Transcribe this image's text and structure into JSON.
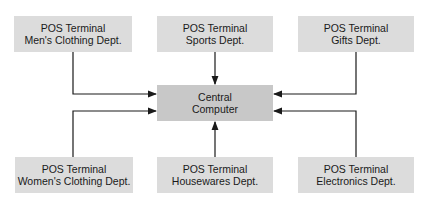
{
  "diagram": {
    "central": {
      "line1": "Central",
      "line2": "Computer"
    },
    "terminals": [
      {
        "id": "mens",
        "line1": "POS Terminal",
        "line2": "Men's Clothing Dept."
      },
      {
        "id": "sports",
        "line1": "POS Terminal",
        "line2": "Sports Dept."
      },
      {
        "id": "gifts",
        "line1": "POS Terminal",
        "line2": "Gifts Dept."
      },
      {
        "id": "womens",
        "line1": "POS Terminal",
        "line2": "Women's Clothing Dept."
      },
      {
        "id": "housewares",
        "line1": "POS Terminal",
        "line2": "Housewares Dept."
      },
      {
        "id": "electronics",
        "line1": "POS Terminal",
        "line2": "Electronics Dept."
      }
    ],
    "colors": {
      "terminal_fill": "#dcdcdc",
      "central_fill": "#c8c8c8",
      "line": "#1a1a1a"
    },
    "edges": [
      {
        "from": "mens",
        "to": "central"
      },
      {
        "from": "sports",
        "to": "central"
      },
      {
        "from": "gifts",
        "to": "central"
      },
      {
        "from": "womens",
        "to": "central"
      },
      {
        "from": "housewares",
        "to": "central"
      },
      {
        "from": "electronics",
        "to": "central"
      }
    ]
  }
}
